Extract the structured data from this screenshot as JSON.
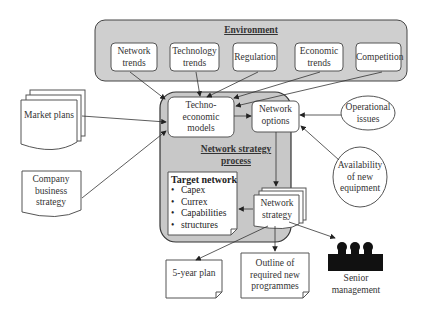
{
  "environment": {
    "title": "Environment",
    "items": [
      "Network trends",
      "Technology trends",
      "Regulation",
      "Economic trends",
      "Competition"
    ]
  },
  "inputs": {
    "market_plans": "Market plans",
    "company_business_strategy": "Company business strategy",
    "operational_issues": "Operational issues",
    "availability_of_new_equipment": "Availability of new equipment"
  },
  "process": {
    "title": "Network strategy process",
    "techno_economic_models": "Techno-economic models",
    "network_options": "Network options",
    "network_strategy": "Network strategy",
    "target_network": {
      "title": "Target network",
      "items": [
        "Capex",
        "Currex",
        "Capabilities",
        "structures"
      ]
    }
  },
  "outputs": {
    "five_year_plan": "5-year plan",
    "outline_of_programmes": "Outline of required new programmes",
    "senior_management": "Senior management"
  },
  "colors": {
    "env_fill": "#cfcfcf",
    "process_fill": "#c8c8c8",
    "stroke": "#333333"
  }
}
